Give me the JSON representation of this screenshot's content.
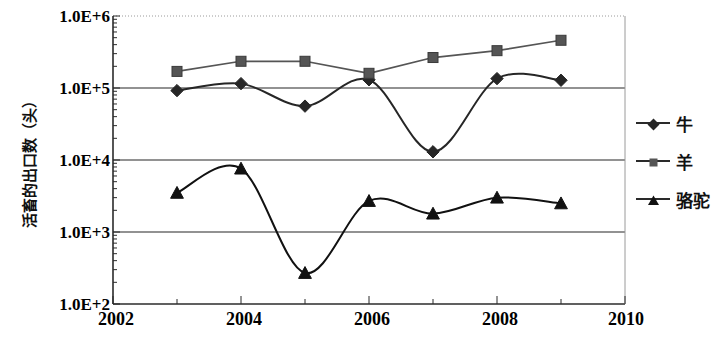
{
  "chart_data": {
    "type": "line",
    "title": "",
    "xlabel": "",
    "ylabel": "活畜的出口数（头）",
    "x": [
      2003,
      2004,
      2005,
      2006,
      2007,
      2008,
      2009
    ],
    "xlim": [
      2002,
      2010
    ],
    "ylim": [
      100,
      1000000
    ],
    "yscale": "log",
    "grid": true,
    "legend_position": "right",
    "xticks": [
      "2002",
      "2004",
      "2006",
      "2008",
      "2010"
    ],
    "xtick_values": [
      2002,
      2004,
      2006,
      2008,
      2010
    ],
    "yticks": [
      "1.0E+2",
      "1.0E+3",
      "1.0E+4",
      "1.0E+5",
      "1.0E+6"
    ],
    "ytick_values": [
      100,
      1000,
      10000,
      100000,
      1000000
    ],
    "series": [
      {
        "name": "牛",
        "marker": "diamond",
        "color": "#262626",
        "values": [
          92000,
          115000,
          56000,
          130000,
          13000,
          135000,
          128000
        ]
      },
      {
        "name": "羊",
        "marker": "square",
        "color": "#555555",
        "values": [
          170000,
          235000,
          235000,
          160000,
          265000,
          330000,
          460000
        ]
      },
      {
        "name": "骆驼",
        "marker": "triangle",
        "color": "#111111",
        "values": [
          3500,
          7600,
          270,
          2700,
          1800,
          3000,
          2500
        ]
      }
    ]
  },
  "axes": {
    "y_title": "活畜的出口数（头）",
    "y_labels": [
      "1.0E+6",
      "1.0E+5",
      "1.0E+4",
      "1.0E+3",
      "1.0E+2"
    ],
    "x_labels": [
      "2002",
      "2004",
      "2006",
      "2008",
      "2010"
    ]
  },
  "legend": {
    "items": [
      {
        "label": "牛",
        "marker": "diamond-marker"
      },
      {
        "label": "羊",
        "marker": "square-marker"
      },
      {
        "label": "骆驼",
        "marker": "triangle-marker"
      }
    ]
  },
  "colors": {
    "cattle": "#262626",
    "sheep": "#555555",
    "camel": "#111111",
    "grid": "#6e6e6e",
    "axis": "#2b2b2b"
  }
}
